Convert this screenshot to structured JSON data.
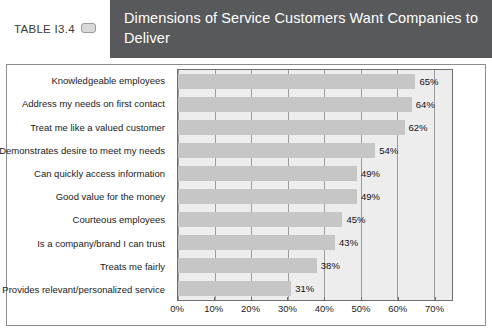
{
  "header": {
    "table_label": "TABLE I3.4",
    "icon": "pill-icon",
    "title": "Dimensions of Service Customers Want Companies to Deliver",
    "band_color": "#58595b"
  },
  "chart_data": {
    "type": "bar",
    "orientation": "horizontal",
    "title": "Dimensions of Service Customers Want Companies to Deliver",
    "xlabel": "",
    "ylabel": "",
    "xlim": [
      0,
      75
    ],
    "grid": true,
    "legend": false,
    "bar_color": "#c6c6c6",
    "plot_background": "#ededed",
    "categories": [
      "Knowledgeable employees",
      "Address my needs on first contact",
      "Treat me like a valued customer",
      "Demonstrates desire to meet my needs",
      "Can quickly access information",
      "Good value for the money",
      "Courteous employees",
      "Is a company/brand I can trust",
      "Treats me fairly",
      "Provides relevant/personalized service"
    ],
    "values": [
      65,
      64,
      62,
      54,
      49,
      49,
      45,
      43,
      38,
      31
    ],
    "value_labels": [
      "65%",
      "64%",
      "62%",
      "54%",
      "49%",
      "49%",
      "45%",
      "43%",
      "38%",
      "31%"
    ],
    "xticks": [
      0,
      10,
      20,
      30,
      40,
      50,
      60,
      70
    ],
    "xticklabels": [
      "0%",
      "10%",
      "20%",
      "30%",
      "40%",
      "50%",
      "60%",
      "70%"
    ]
  }
}
